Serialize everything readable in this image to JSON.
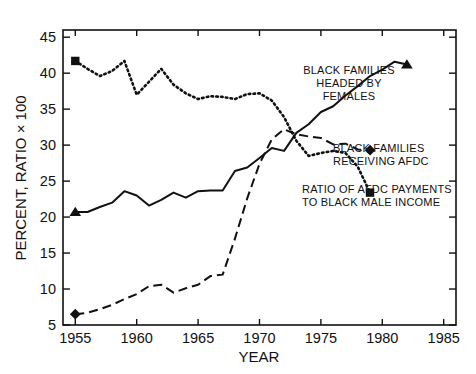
{
  "chart_data": {
    "type": "line",
    "title": "",
    "xlabel": "YEAR",
    "ylabel": "PERCENT, RATIO × 100",
    "xlim": [
      1954,
      1986
    ],
    "ylim": [
      5,
      46
    ],
    "xticks": [
      1955,
      1960,
      1965,
      1970,
      1975,
      1980,
      1985
    ],
    "xticklabels": [
      "1955",
      "1960",
      "1965",
      "1970",
      "1975",
      "1980",
      "1985"
    ],
    "yticks": [
      5,
      10,
      15,
      20,
      25,
      30,
      35,
      40,
      45
    ],
    "yticklabels": [
      "5",
      "10",
      "15",
      "20",
      "25",
      "30",
      "35",
      "40",
      "45"
    ],
    "grid": false,
    "legend_position": "inline-annotations",
    "series": [
      {
        "name": "BLACK FAMILIES HEADED BY FEMALES",
        "style": "solid",
        "marker_start": "triangle",
        "marker_end": "triangle",
        "annotation": "BLACK FAMILIES\nHEADED BY\nFEMALES",
        "x": [
          1955,
          1956,
          1957,
          1958,
          1959,
          1960,
          1961,
          1962,
          1963,
          1964,
          1965,
          1966,
          1967,
          1968,
          1969,
          1970,
          1971,
          1972,
          1973,
          1974,
          1975,
          1976,
          1977,
          1978,
          1979,
          1980,
          1981,
          1982
        ],
        "values": [
          20.7,
          20.7,
          21.4,
          22.0,
          23.6,
          23.0,
          21.6,
          22.4,
          23.4,
          22.7,
          23.6,
          23.7,
          23.7,
          26.4,
          26.9,
          28.2,
          29.6,
          29.2,
          31.7,
          32.9,
          34.6,
          35.4,
          36.9,
          38.2,
          39.6,
          40.5,
          41.6,
          41.2
        ]
      },
      {
        "name": "BLACK FAMILIES RECEIVING AFDC",
        "style": "dotted",
        "marker_start": "square",
        "marker_end": "square",
        "annotation": "BLACK FAMILIES\nRECEIVING AFDC",
        "x": [
          1955,
          1956,
          1957,
          1958,
          1959,
          1960,
          1961,
          1962,
          1963,
          1964,
          1965,
          1966,
          1967,
          1968,
          1969,
          1970,
          1971,
          1972,
          1973,
          1974,
          1975,
          1976,
          1977,
          1978,
          1979
        ],
        "values": [
          41.7,
          40.6,
          39.6,
          40.3,
          41.7,
          37.0,
          38.8,
          40.6,
          38.4,
          37.2,
          36.4,
          36.8,
          36.7,
          36.4,
          37.1,
          37.2,
          36.2,
          33.9,
          30.6,
          28.5,
          28.9,
          29.2,
          28.9,
          27.0,
          23.4
        ]
      },
      {
        "name": "RATIO OF AFDC PAYMENTS TO BLACK MALE INCOME",
        "style": "dashed",
        "marker_start": "diamond",
        "marker_end": "diamond",
        "annotation": "RATIO OF AFDC PAYMENTS\nTO BLACK MALE INCOME",
        "x": [
          1955,
          1956,
          1957,
          1958,
          1959,
          1960,
          1961,
          1962,
          1963,
          1964,
          1965,
          1966,
          1967,
          1968,
          1969,
          1970,
          1971,
          1972,
          1973,
          1974,
          1975,
          1976,
          1977,
          1978,
          1979
        ],
        "values": [
          6.5,
          6.7,
          7.2,
          7.8,
          8.6,
          9.3,
          10.4,
          10.6,
          9.5,
          10.1,
          10.6,
          11.8,
          12.0,
          17.0,
          22.6,
          27.4,
          30.8,
          32.2,
          31.5,
          31.2,
          31.0,
          30.1,
          30.2,
          29.4,
          29.3
        ]
      }
    ],
    "annotations": [
      {
        "id": "a1",
        "text_lines": [
          "BLACK FAMILIES",
          "HEADED BY",
          "FEMALES"
        ],
        "anchor_year": 1982,
        "anchor_value": 41.2
      },
      {
        "id": "a2",
        "text_lines": [
          "BLACK FAMILIES",
          "RECEIVING AFDC"
        ],
        "anchor_year": 1979,
        "anchor_value": 29.3
      },
      {
        "id": "a3",
        "text_lines": [
          "RATIO OF AFDC PAYMENTS",
          "TO  BLACK  MALE  INCOME"
        ],
        "anchor_year": 1979,
        "anchor_value": 23.4
      }
    ],
    "colors": {
      "line": "#111111",
      "axis": "#111111",
      "background": "#ffffff"
    }
  }
}
